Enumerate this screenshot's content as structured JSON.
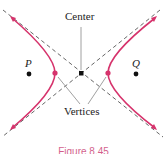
{
  "diagram": {
    "labels": {
      "center": "Center",
      "vertices": "Vertices",
      "focus_left": "P",
      "focus_right": "Q"
    },
    "caption": "Figure 8.45",
    "colors": {
      "curve": "#d6336c",
      "asymptote": "#555555",
      "point": "#111111",
      "leader": "#888888"
    },
    "points": {
      "center": [
        81,
        73
      ],
      "vertex_left": [
        55,
        73
      ],
      "vertex_right": [
        108,
        73
      ],
      "P": [
        29,
        73
      ],
      "Q": [
        136,
        73
      ]
    }
  }
}
